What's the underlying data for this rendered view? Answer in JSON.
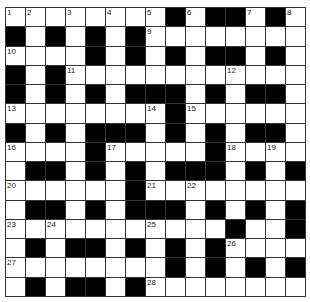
{
  "puzzle": {
    "rows": 15,
    "cols": 15,
    "grid": [
      "........#.##.#.",
      "#.#.#.#........",
      "....#.#.#.##.#.",
      "#.#............",
      "#.#.#.###.#.##.",
      "........#......",
      "#.#.###.#.#.##.",
      "....#.....#....",
      ".##.#.#.###.#.#",
      "......#........",
      ".##.#.###.#.#.#",
      "...........#..#",
      ".#.##.#.#.#....",
      "........#.#.#.#",
      ".#.##.#........"
    ],
    "numbers": [
      {
        "r": 0,
        "c": 0,
        "n": "1"
      },
      {
        "r": 0,
        "c": 1,
        "n": "2"
      },
      {
        "r": 0,
        "c": 3,
        "n": "3"
      },
      {
        "r": 0,
        "c": 5,
        "n": "4"
      },
      {
        "r": 0,
        "c": 7,
        "n": "5"
      },
      {
        "r": 0,
        "c": 9,
        "n": "6"
      },
      {
        "r": 0,
        "c": 12,
        "n": "7"
      },
      {
        "r": 0,
        "c": 14,
        "n": "8"
      },
      {
        "r": 1,
        "c": 7,
        "n": "9"
      },
      {
        "r": 2,
        "c": 0,
        "n": "10"
      },
      {
        "r": 3,
        "c": 3,
        "n": "11"
      },
      {
        "r": 3,
        "c": 11,
        "n": "12"
      },
      {
        "r": 5,
        "c": 0,
        "n": "13"
      },
      {
        "r": 5,
        "c": 7,
        "n": "14"
      },
      {
        "r": 5,
        "c": 9,
        "n": "15"
      },
      {
        "r": 7,
        "c": 0,
        "n": "16"
      },
      {
        "r": 7,
        "c": 5,
        "n": "17"
      },
      {
        "r": 7,
        "c": 11,
        "n": "18"
      },
      {
        "r": 7,
        "c": 13,
        "n": "19"
      },
      {
        "r": 9,
        "c": 0,
        "n": "20"
      },
      {
        "r": 9,
        "c": 7,
        "n": "21"
      },
      {
        "r": 9,
        "c": 9,
        "n": "22"
      },
      {
        "r": 11,
        "c": 0,
        "n": "23"
      },
      {
        "r": 11,
        "c": 2,
        "n": "24"
      },
      {
        "r": 11,
        "c": 7,
        "n": "25"
      },
      {
        "r": 12,
        "c": 11,
        "n": "26"
      },
      {
        "r": 13,
        "c": 0,
        "n": "27"
      },
      {
        "r": 14,
        "c": 7,
        "n": "28"
      }
    ],
    "colors": {
      "black": "#000000",
      "white": "#ffffff",
      "line": "#333333"
    }
  }
}
